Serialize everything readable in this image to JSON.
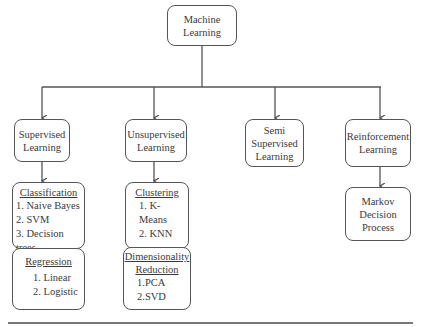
{
  "root": {
    "label_line1": "Machine",
    "label_line2": "Learning"
  },
  "categories": [
    {
      "id": "supervised",
      "line1": "Supervised",
      "line2": "Learning"
    },
    {
      "id": "unsupervised",
      "line1": "Unsupervised",
      "line2": "Learning"
    },
    {
      "id": "semi",
      "line1": "Semi",
      "line2": "Supervised",
      "line3": "Learning"
    },
    {
      "id": "reinforcement",
      "line1": "Reinforcement",
      "line2": "Learning"
    }
  ],
  "subgroups": {
    "classification": {
      "heading": "Classification",
      "items": [
        "1. Naive Bayes",
        "2. SVM",
        "3. Decision trees"
      ]
    },
    "regression": {
      "heading": "Regression",
      "items": [
        "1. Linear",
        "2. Logistic"
      ]
    },
    "clustering": {
      "heading": "Clustering",
      "items": [
        "1. K-Means",
        "2. KNN"
      ]
    },
    "dimensionality": {
      "heading_line1": "Dimensionality",
      "heading_line2": "Reduction",
      "items": [
        "1.PCA",
        "2.SVD"
      ]
    },
    "markov": {
      "line1": "Markov",
      "line2": "Decision",
      "line3": "Process"
    }
  },
  "colors": {
    "stroke": "#555555",
    "text": "#3a3a3a",
    "background": "#ffffff"
  }
}
